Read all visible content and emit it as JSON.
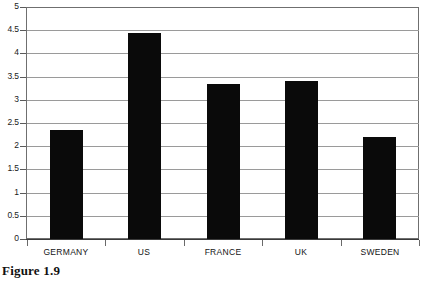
{
  "figure": {
    "caption": "Figure 1.9"
  },
  "chart_data": {
    "type": "bar",
    "title": "",
    "subtitle": "",
    "xlabel": "",
    "ylabel": "",
    "categories": [
      "GERMANY",
      "US",
      "FRANCE",
      "UK",
      "SWEDEN"
    ],
    "values": [
      2.35,
      4.45,
      3.35,
      3.4,
      2.2
    ],
    "series": [
      {
        "name": "",
        "values": [
          2.35,
          4.45,
          3.35,
          3.4,
          2.2
        ]
      }
    ],
    "ylim": [
      0,
      5
    ],
    "yticks": [
      0,
      0.5,
      1,
      1.5,
      2,
      2.5,
      3,
      3.5,
      4,
      4.5,
      5
    ],
    "ytick_labels": [
      "0",
      "0.5",
      "1",
      "1.5",
      "2",
      "2.5",
      "3",
      "3.5",
      "4",
      "4.5",
      "5"
    ],
    "grid": true,
    "grid_axis": "y",
    "legend": false,
    "legend_position": "none",
    "annotations": [],
    "colors": {
      "bar_fill": "#0a0a0a",
      "gridline": "#9a9a9a",
      "axis": "#4a4a4a",
      "frame": "#6f6f6f",
      "background": "#ffffff",
      "text": "#141414"
    }
  }
}
